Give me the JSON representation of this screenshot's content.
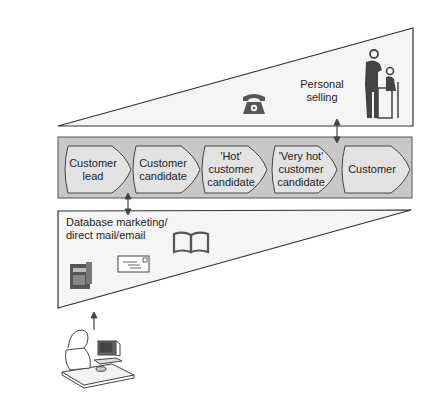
{
  "top_section": {
    "label_line1": "Personal",
    "label_line2": "selling",
    "icons": [
      "telephone-icon",
      "salesperson-meeting-icon"
    ]
  },
  "funnel_band": {
    "stages": [
      {
        "label": "Customer lead"
      },
      {
        "label": "Customer candidate"
      },
      {
        "label": "'Hot' customer candidate"
      },
      {
        "label": "'Very hot' customer candidate"
      },
      {
        "label": "Customer"
      }
    ]
  },
  "bottom_section": {
    "label_line1": "Database marketing/",
    "label_line2": "direct mail/email",
    "icons": [
      "catalog-icon",
      "envelope-icon",
      "open-book-icon"
    ]
  },
  "footer": {
    "icons": [
      "person-at-computer-icon"
    ]
  },
  "colors": {
    "band_fill": "#c8c8c8",
    "stage_fill": "#e2e2e2",
    "triangle_fill": "#f4f4f4",
    "line": "#333333",
    "icon": "#444444"
  }
}
